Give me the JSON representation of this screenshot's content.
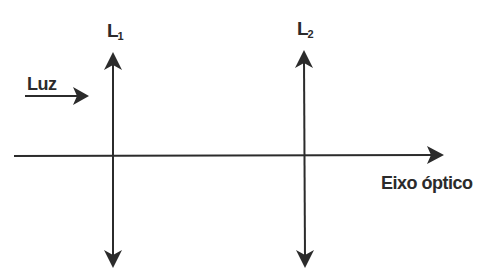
{
  "diagram": {
    "light_label": "Luz",
    "axis_label": "Eixo óptico",
    "lenses": [
      {
        "letter": "L",
        "subscript": "1"
      },
      {
        "letter": "L",
        "subscript": "2"
      }
    ],
    "colors": {
      "stroke": "#2b2b2b",
      "background": "#ffffff"
    }
  }
}
